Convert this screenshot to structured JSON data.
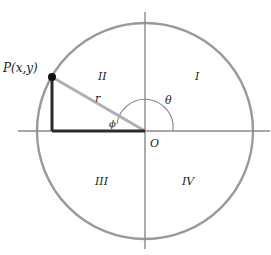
{
  "diagram": {
    "type": "unit-circle-quadrants",
    "colors": {
      "circle": "#9a9a9a",
      "axes": "#8a8a8a",
      "radius": "#b0b0b0",
      "legs": "#2a2a2a",
      "point": "#111111",
      "text": "#222222"
    },
    "point_label": "P(x,y)",
    "radius_label": "r",
    "angle_theta_label": "θ",
    "angle_phi_label": "ϕ",
    "origin_label": "O",
    "quadrants": {
      "q1": "I",
      "q2": "II",
      "q3": "III",
      "q4": "IV"
    }
  }
}
